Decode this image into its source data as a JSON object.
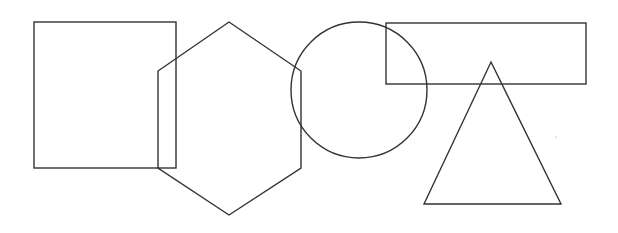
{
  "canvas": {
    "width": 618,
    "height": 233,
    "background": "#ffffff",
    "stroke": "#333333"
  },
  "shapes": [
    {
      "type": "square",
      "x": 34,
      "y": 22,
      "width": 142,
      "height": 146
    },
    {
      "type": "hexagon",
      "points": "229,22 301,71 301,168 229,215 158,168 158,71"
    },
    {
      "type": "circle",
      "cx": 359,
      "cy": 90,
      "r": 68
    },
    {
      "type": "rectangle",
      "x": 386,
      "y": 23,
      "width": 200,
      "height": 61
    },
    {
      "type": "triangle",
      "points": "491,62 561,204 424,204"
    },
    {
      "type": "dot",
      "cx": 556,
      "cy": 137,
      "r": 0.6
    }
  ]
}
